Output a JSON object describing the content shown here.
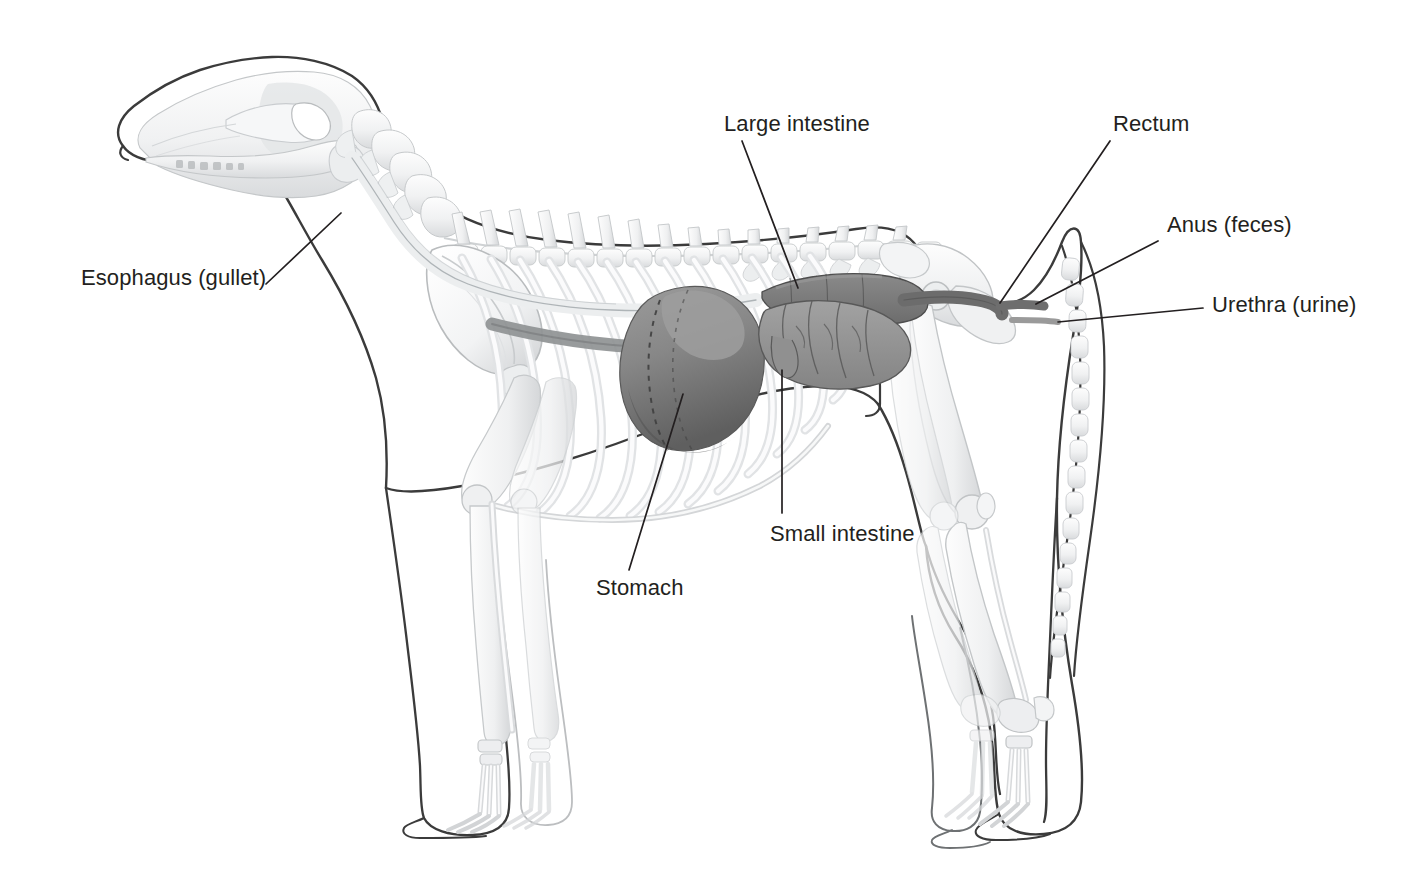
{
  "figure": {
    "view": "lateral (side) view, facing left",
    "background_color": "#ffffff",
    "label_text_color": "#231f20",
    "leader_line_color": "#231f20",
    "body_outline_color": "#3b3b3b",
    "skeleton_color": "#e8e9ea",
    "skeleton_shade_color": "#c9cbcd"
  },
  "labels": [
    {
      "id": "esophagus",
      "text": "Esophagus (gullet)",
      "leader": {
        "from_x": 266,
        "from_y": 284,
        "to_x": 341,
        "to_y": 213
      }
    },
    {
      "id": "large_intestine",
      "text": "Large intestine",
      "leader": {
        "from_x": 742,
        "from_y": 141,
        "to_x": 798,
        "to_y": 288
      }
    },
    {
      "id": "rectum",
      "text": "Rectum",
      "leader": {
        "from_x": 1110,
        "from_y": 141,
        "to_x": 1000,
        "to_y": 303
      }
    },
    {
      "id": "anus",
      "text": "Anus (feces)",
      "leader": {
        "from_x": 1158,
        "from_y": 241,
        "to_x": 1036,
        "to_y": 304
      }
    },
    {
      "id": "urethra",
      "text": "Urethra (urine)",
      "leader": {
        "from_x": 1203,
        "from_y": 308,
        "to_x": 1058,
        "to_y": 322
      }
    },
    {
      "id": "small_intestine",
      "text": "Small intestine",
      "leader": {
        "from_x": 782,
        "from_y": 513,
        "to_x": 782,
        "to_y": 370
      }
    },
    {
      "id": "stomach",
      "text": "Stomach",
      "leader": {
        "from_x": 629,
        "from_y": 570,
        "to_x": 683,
        "to_y": 394
      }
    }
  ],
  "organs": [
    {
      "id": "esophagus_tube",
      "name": "Esophagus (gullet)",
      "color": "#f2f3f4",
      "outline": "#8b8f93"
    },
    {
      "id": "stomach",
      "name": "Stomach",
      "color": "#8b8b8b",
      "shade": "#636363"
    },
    {
      "id": "small_intestine",
      "name": "Small intestine",
      "color": "#969696",
      "outline": "#5d5d5d"
    },
    {
      "id": "large_intestine",
      "name": "Large intestine",
      "color": "#767676",
      "outline": "#4f4f4f"
    },
    {
      "id": "rectum",
      "name": "Rectum",
      "color": "#6e6e6e"
    },
    {
      "id": "diaphragm",
      "name": "Diaphragm band",
      "color": "#8f9193"
    }
  ],
  "skeleton_parts": [
    "skull",
    "mandible",
    "cervical vertebrae",
    "thoracic vertebrae",
    "lumbar vertebrae",
    "sacrum",
    "caudal (tail) vertebrae",
    "ribs",
    "sternum",
    "scapula",
    "humerus",
    "radius",
    "ulna",
    "carpus",
    "metacarpals",
    "phalanges",
    "pelvis",
    "femur",
    "patella",
    "tibia",
    "fibula",
    "tarsus",
    "metatarsals"
  ]
}
